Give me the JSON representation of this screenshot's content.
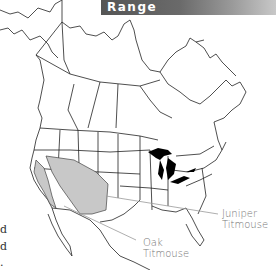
{
  "header": {
    "title": "Range"
  },
  "map": {
    "region": "North America",
    "colors": {
      "range_fill": "#c8c8c8",
      "outline": "#222222",
      "lakes": "#000000",
      "title_bg": "#555555"
    },
    "labels": [
      {
        "id": "juniper",
        "line1": "Juniper",
        "line2": "Titmouse"
      },
      {
        "id": "oak",
        "line1": "Oak",
        "line2": "Titmouse"
      }
    ]
  },
  "side_text": [
    "d",
    "d",
    "."
  ]
}
